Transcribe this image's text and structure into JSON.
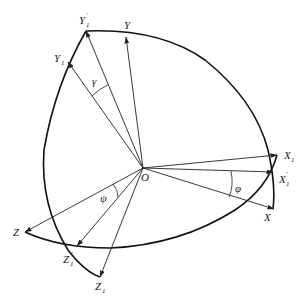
{
  "diagram": {
    "type": "coordinate-rotation-diagram",
    "origin": {
      "label": "O",
      "x": 143,
      "y": 168
    },
    "vectors": [
      {
        "id": "Y1p",
        "label": "Y",
        "sub": "1",
        "prime": true,
        "tip": [
          86,
          31
        ],
        "label_pos": [
          76,
          22
        ]
      },
      {
        "id": "Y",
        "label": "Y",
        "sub": "",
        "prime": false,
        "tip": [
          126,
          37
        ],
        "label_pos": [
          124,
          28
        ]
      },
      {
        "id": "Y1",
        "label": "Y",
        "sub": "1",
        "prime": false,
        "tip": [
          68,
          62
        ],
        "label_pos": [
          53,
          62
        ]
      },
      {
        "id": "X1",
        "label": "X",
        "sub": "1",
        "prime": false,
        "tip": [
          277,
          155
        ],
        "label_pos": [
          283,
          159
        ]
      },
      {
        "id": "X1p",
        "label": "X",
        "sub": "1",
        "prime": true,
        "tip": [
          273,
          172
        ],
        "label_pos": [
          278,
          182
        ]
      },
      {
        "id": "X",
        "label": "X",
        "sub": "",
        "prime": false,
        "tip": [
          274,
          209
        ],
        "label_pos": [
          266,
          220
        ]
      },
      {
        "id": "Z",
        "label": "Z",
        "sub": "",
        "prime": false,
        "tip": [
          25,
          232
        ],
        "label_pos": [
          12,
          236
        ]
      },
      {
        "id": "Z1p",
        "label": "Z",
        "sub": "1",
        "prime": true,
        "tip": [
          77,
          246
        ],
        "label_pos": [
          62,
          262
        ]
      },
      {
        "id": "Z1",
        "label": "Z",
        "sub": "1",
        "prime": false,
        "tip": [
          100,
          277
        ],
        "label_pos": [
          94,
          289
        ]
      }
    ],
    "angles": [
      {
        "symbol": "γ",
        "between": [
          "Y1",
          "Y1p"
        ],
        "label_pos": [
          92,
          84
        ]
      },
      {
        "symbol": "φ",
        "between": [
          "X1p",
          "X"
        ],
        "label_pos": [
          237,
          192
        ]
      },
      {
        "symbol": "ψ",
        "between": [
          "Z",
          "Z1p"
        ],
        "label_pos": [
          101,
          201
        ]
      }
    ],
    "labels": {
      "O": "O",
      "Y1p": "Y",
      "Y": "Y",
      "Y1": "Y",
      "X1": "X",
      "X1p": "X",
      "X": "X",
      "Z": "Z",
      "Z1p": "Z",
      "Z1": "Z",
      "sub1": "1",
      "prime": "′",
      "gamma": "γ",
      "phi": "φ",
      "psi": "ψ"
    }
  }
}
